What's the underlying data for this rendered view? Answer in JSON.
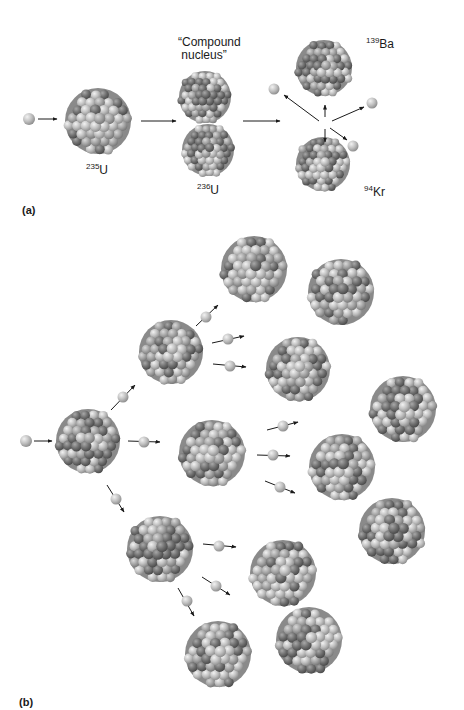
{
  "figure": {
    "panel_a": {
      "label": "(a)",
      "title": "Single fission event of uranium-235",
      "compound_label_line1": "“Compound",
      "compound_label_line2": " nucleus”",
      "u235": {
        "mass": "235",
        "symbol": "U"
      },
      "u236": {
        "mass": "236",
        "symbol": "U"
      },
      "ba139": {
        "mass": "139",
        "symbol": "Ba"
      },
      "kr94": {
        "mass": "94",
        "symbol": "Kr"
      }
    },
    "panel_b": {
      "label": "(b)",
      "title": "Fission chain reaction"
    },
    "colors": {
      "neutron": "#c4c4c4",
      "proton": "#7a7a7a",
      "arrow": "#1a1a1a",
      "background": "#ffffff"
    }
  }
}
